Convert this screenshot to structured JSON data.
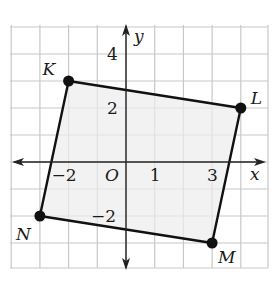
{
  "figure": {
    "type": "coordinate-plane",
    "grid": {
      "x_min": -4,
      "x_max": 5,
      "y_min": -4,
      "y_max": 5,
      "origin_px": [
        126,
        162
      ],
      "unit_px_x": 28.7,
      "unit_px_y": 27,
      "left_px": 10,
      "right_px": 268,
      "top_px": 25,
      "bottom_px": 268,
      "line_color": "#c8c8c8"
    },
    "axes": {
      "x_label": "x",
      "y_label": "y",
      "origin_label": "O",
      "x_tick_labels": [
        {
          "value": -2,
          "text": "−2"
        },
        {
          "value": 1,
          "text": "1"
        },
        {
          "value": 3,
          "text": "3"
        }
      ],
      "y_tick_labels": [
        {
          "value": 4,
          "text": "4"
        },
        {
          "value": 2,
          "text": "2"
        },
        {
          "value": -2,
          "text": "−2"
        }
      ]
    },
    "quadrilateral": {
      "fill": "#ececec",
      "stroke": "#111111",
      "vertices": [
        {
          "name": "K",
          "x": -2,
          "y": 3
        },
        {
          "name": "L",
          "x": 4,
          "y": 2
        },
        {
          "name": "M",
          "x": 3,
          "y": -3
        },
        {
          "name": "N",
          "x": -3,
          "y": -2
        }
      ]
    }
  }
}
